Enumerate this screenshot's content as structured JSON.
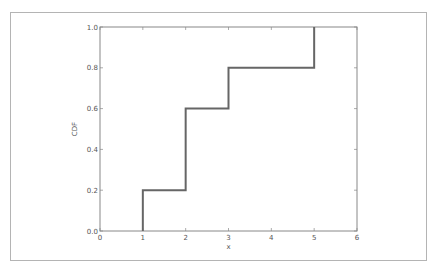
{
  "chart_data": {
    "type": "line",
    "subtype": "step",
    "title": "",
    "xlabel": "x",
    "ylabel": "CDF",
    "xlim": [
      0,
      6
    ],
    "ylim": [
      0.0,
      1.0
    ],
    "xticks": [
      "0",
      "1",
      "2",
      "3",
      "4",
      "5",
      "6"
    ],
    "yticks": [
      "0.0",
      "0.2",
      "0.4",
      "0.6",
      "0.8",
      "1.0"
    ],
    "grid": false,
    "legend": null,
    "series": [
      {
        "name": "CDF",
        "color": "#666666",
        "x": [
          1,
          1,
          2,
          2,
          3,
          3,
          5,
          5
        ],
        "y": [
          0.0,
          0.2,
          0.2,
          0.6,
          0.6,
          0.8,
          0.8,
          1.0
        ]
      }
    ]
  },
  "colors": {
    "line": "#666666",
    "axes": "#888888",
    "frame": "#b4b4b4",
    "text": "#555555"
  }
}
